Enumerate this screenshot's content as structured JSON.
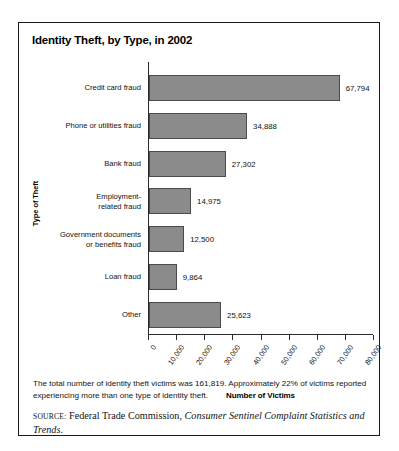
{
  "figure": {
    "title": "Identity Theft, by Type, in 2002",
    "note": "The total number of identity theft victims was 161,819. Approximately 22% of victims reported experiencing more than one type of identity theft.",
    "source_label": "Source:",
    "source_text": "Federal Trade Commission,",
    "source_italic": "Consumer Sentinel Complaint Statistics and Trends",
    "source_period": ".",
    "border_color": "#1a1a1a"
  },
  "chart_data": {
    "type": "bar",
    "orientation": "horizontal",
    "title": "Identity Theft, by Type, in 2002",
    "xlabel": "Number of Victims",
    "ylabel": "Type of Theft",
    "categories": [
      "Credit card fraud",
      "Phone or utilities fraud",
      "Bank fraud",
      "Employment-\nrelated fraud",
      "Government documents\nor benefits fraud",
      "Loan fraud",
      "Other"
    ],
    "values": [
      67794,
      34888,
      27302,
      14975,
      12500,
      9864,
      25623
    ],
    "value_labels": [
      "67,794",
      "34,888",
      "27,302",
      "14,975",
      "12,500",
      "9,864",
      "25,623"
    ],
    "xlim": [
      0,
      80000
    ],
    "xticks": [
      0,
      10000,
      20000,
      30000,
      40000,
      50000,
      60000,
      70000,
      80000
    ],
    "xtick_labels": [
      "0",
      "10,000",
      "20,000",
      "30,000",
      "40,000",
      "50,000",
      "60,000",
      "70,000",
      "80,000"
    ],
    "xtick_label_rotation": -55,
    "grid": false,
    "legend": false,
    "bar_fill_color": "#8b8b8b",
    "bar_edge_color": "#4a4a4a"
  }
}
